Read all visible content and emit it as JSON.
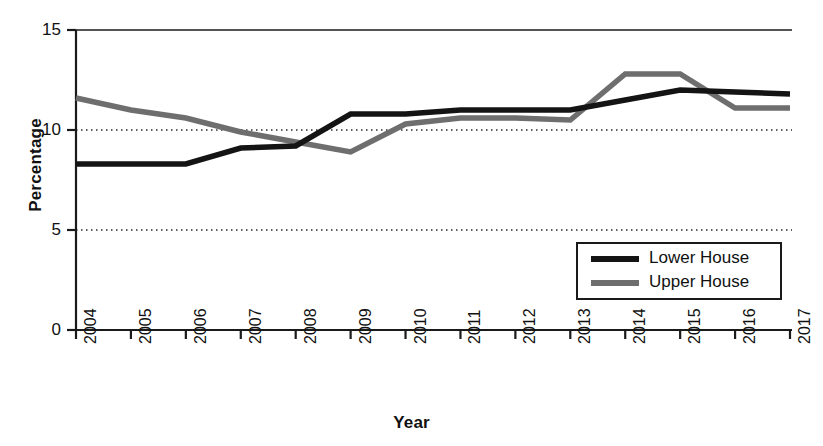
{
  "chart_data": {
    "type": "line",
    "title": "",
    "xlabel": "Year",
    "ylabel": "Percentage",
    "categories": [
      "2004",
      "2005",
      "2006",
      "2007",
      "2008",
      "2009",
      "2010",
      "2011",
      "2012",
      "2013",
      "2014",
      "2015",
      "2016",
      "2017"
    ],
    "x": [
      2004,
      2005,
      2006,
      2007,
      2008,
      2009,
      2010,
      2011,
      2012,
      2013,
      2014,
      2015,
      2016,
      2017
    ],
    "series": [
      {
        "name": "Lower House",
        "color": "#141414",
        "values": [
          8.3,
          8.3,
          8.3,
          9.1,
          9.2,
          10.8,
          10.8,
          11.0,
          11.0,
          11.0,
          11.5,
          12.0,
          11.9,
          11.8
        ]
      },
      {
        "name": "Upper House",
        "color": "#6e6e6e",
        "values": [
          11.6,
          11.0,
          10.6,
          9.9,
          9.4,
          8.9,
          10.3,
          10.6,
          10.6,
          10.5,
          12.8,
          12.8,
          11.1,
          11.1
        ]
      }
    ],
    "ylim": [
      0,
      15
    ],
    "yticks": [
      0,
      5,
      10,
      15
    ],
    "ytick_labels": [
      "0",
      "5",
      "10",
      "15"
    ],
    "gridlines": {
      "y": [
        5,
        10
      ],
      "style": "dotted",
      "x": false
    },
    "legend": {
      "position": "bottom-right",
      "entries": [
        {
          "label": "Lower House",
          "color": "#141414"
        },
        {
          "label": "Upper House",
          "color": "#6e6e6e"
        }
      ]
    },
    "axis": {
      "line_color": "#1a1a1a",
      "xtick_rotation": -90
    }
  }
}
